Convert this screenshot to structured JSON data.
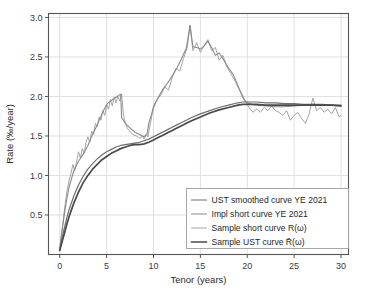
{
  "chart_data": {
    "type": "line",
    "title": "",
    "xlabel": "Tenor (years)",
    "ylabel": "Rate (‰/year)",
    "xlim": [
      -1.2,
      30.8
    ],
    "ylim": [
      0.0,
      3.05
    ],
    "xticks": [
      0,
      5,
      10,
      15,
      20,
      25,
      30
    ],
    "xtick_labels": [
      "0",
      "5",
      "10",
      "15",
      "20",
      "25",
      "30"
    ],
    "yticks": [
      0.5,
      1.0,
      1.5,
      2.0,
      2.5,
      3.0
    ],
    "ytick_labels": [
      "0.5",
      "1.0",
      "1.5",
      "2.0",
      "2.5",
      "3.0"
    ],
    "grid": true,
    "grid_color": "#d8d8d8",
    "legend_position": "lower right",
    "background": "#ffffff",
    "series": [
      {
        "name": "UST smoothed curve YE 2021",
        "legend_label": "UST smoothed curve YE 2021",
        "color": "#6e6e6e",
        "width": 1.2,
        "style": "smooth",
        "x": [
          0.0,
          0.25,
          0.5,
          0.75,
          1.0,
          1.5,
          2.0,
          2.5,
          3.0,
          3.5,
          4.0,
          4.5,
          5.0,
          5.5,
          6.0,
          6.5,
          7.0,
          7.5,
          8.0,
          8.5,
          9.0,
          9.5,
          10.0,
          10.5,
          11.0,
          11.5,
          12.0,
          12.5,
          13.0,
          13.5,
          14.0,
          15.0,
          16.0,
          17.0,
          18.0,
          19.0,
          19.5,
          20.0,
          21.0,
          22.0,
          23.0,
          24.0,
          25.0,
          26.0,
          27.0,
          28.0,
          29.0,
          30.0
        ],
        "y": [
          0.06,
          0.21,
          0.34,
          0.46,
          0.57,
          0.74,
          0.88,
          0.99,
          1.08,
          1.15,
          1.21,
          1.26,
          1.3,
          1.33,
          1.36,
          1.38,
          1.39,
          1.4,
          1.41,
          1.42,
          1.44,
          1.46,
          1.49,
          1.52,
          1.55,
          1.58,
          1.61,
          1.64,
          1.67,
          1.7,
          1.73,
          1.78,
          1.82,
          1.86,
          1.89,
          1.92,
          1.93,
          1.93,
          1.93,
          1.92,
          1.92,
          1.91,
          1.91,
          1.9,
          1.9,
          1.9,
          1.89,
          1.89
        ]
      },
      {
        "name": "Impl short curve YE 2021",
        "legend_label": "Impl short curve YE 2021",
        "color": "#8a8a8a",
        "width": 1.1,
        "style": "piecewise",
        "x": [
          0.0,
          0.25,
          0.5,
          0.75,
          1.0,
          1.5,
          2.0,
          2.5,
          3.0,
          3.5,
          4.0,
          4.5,
          5.0,
          5.5,
          6.0,
          6.5,
          6.6,
          7.0,
          7.5,
          8.0,
          8.5,
          9.0,
          9.3,
          9.5,
          10.0,
          10.5,
          11.0,
          11.5,
          12.0,
          12.5,
          13.0,
          13.5,
          13.9,
          14.2,
          14.6,
          15.0,
          15.4,
          15.8,
          16.2,
          16.6,
          17.0,
          17.5,
          18.0,
          18.5,
          19.0,
          19.5,
          19.8,
          20.0,
          20.5,
          21.0,
          22.0,
          23.0,
          24.0,
          25.0,
          26.0,
          27.0,
          28.0,
          29.0,
          30.0
        ],
        "y": [
          0.06,
          0.3,
          0.52,
          0.7,
          0.86,
          1.06,
          1.18,
          1.27,
          1.38,
          1.52,
          1.64,
          1.78,
          1.9,
          1.95,
          1.99,
          2.03,
          1.73,
          1.66,
          1.6,
          1.55,
          1.52,
          1.49,
          1.52,
          1.66,
          1.86,
          1.99,
          2.09,
          2.17,
          2.26,
          2.36,
          2.48,
          2.61,
          2.9,
          2.63,
          2.62,
          2.6,
          2.64,
          2.7,
          2.62,
          2.52,
          2.55,
          2.46,
          2.36,
          2.28,
          2.14,
          1.99,
          1.94,
          1.92,
          1.9,
          1.89,
          1.88,
          1.87,
          1.87,
          1.88,
          1.89,
          1.9,
          1.89,
          1.89,
          1.88
        ]
      },
      {
        "name": "Sample short curve R(ω)",
        "legend_label": "Sample short curve R(ω)",
        "color": "#9a9a9a",
        "width": 0.9,
        "style": "noisy",
        "x": [
          0.0,
          0.2,
          0.4,
          0.6,
          0.8,
          1.0,
          1.2,
          1.4,
          1.6,
          1.8,
          2.0,
          2.2,
          2.4,
          2.6,
          2.8,
          3.0,
          3.2,
          3.4,
          3.6,
          3.8,
          4.0,
          4.2,
          4.4,
          4.6,
          4.8,
          5.0,
          5.2,
          5.4,
          5.6,
          5.8,
          6.0,
          6.2,
          6.4,
          6.6,
          6.8,
          7.0,
          7.2,
          7.4,
          7.6,
          7.8,
          8.0,
          8.2,
          8.4,
          8.6,
          8.8,
          9.0,
          9.2,
          9.4,
          9.6,
          9.8,
          10.0,
          10.4,
          10.8,
          11.2,
          11.6,
          12.0,
          12.4,
          12.8,
          13.2,
          13.6,
          13.9,
          14.2,
          14.6,
          15.0,
          15.4,
          15.8,
          16.2,
          16.6,
          17.0,
          17.4,
          17.8,
          18.2,
          18.6,
          19.0,
          19.4,
          19.8,
          20.2,
          20.6,
          21.0,
          21.4,
          21.8,
          22.2,
          22.6,
          23.0,
          23.4,
          23.8,
          24.2,
          24.6,
          25.0,
          25.4,
          25.8,
          26.2,
          26.6,
          27.0,
          27.4,
          27.8,
          28.2,
          28.6,
          29.0,
          29.4,
          29.8,
          30.0
        ],
        "y": [
          0.08,
          0.28,
          0.46,
          0.66,
          0.82,
          0.94,
          1.03,
          1.14,
          1.06,
          1.18,
          1.3,
          1.22,
          1.34,
          1.28,
          1.42,
          1.49,
          1.42,
          1.56,
          1.52,
          1.66,
          1.62,
          1.74,
          1.7,
          1.82,
          1.76,
          1.9,
          1.84,
          1.96,
          1.88,
          1.99,
          1.92,
          2.0,
          1.94,
          2.03,
          1.76,
          1.66,
          1.6,
          1.57,
          1.54,
          1.52,
          1.51,
          1.5,
          1.48,
          1.47,
          1.5,
          1.46,
          1.52,
          1.49,
          1.62,
          1.74,
          1.88,
          1.96,
          2.02,
          2.12,
          2.08,
          2.24,
          2.36,
          2.32,
          2.48,
          2.62,
          2.9,
          2.58,
          2.68,
          2.56,
          2.64,
          2.72,
          2.58,
          2.62,
          2.46,
          2.52,
          2.38,
          2.3,
          2.22,
          2.12,
          2.04,
          1.94,
          1.86,
          1.8,
          1.84,
          1.8,
          1.86,
          1.82,
          1.88,
          1.82,
          1.8,
          1.76,
          1.82,
          1.7,
          1.76,
          1.8,
          1.72,
          1.66,
          1.78,
          1.98,
          1.82,
          1.86,
          1.8,
          1.84,
          1.78,
          1.86,
          1.74,
          1.76
        ]
      },
      {
        "name": "Sample UST curve R̄(ω)",
        "legend_label": "Sample UST curve R̄(ω)",
        "color": "#4a4a4a",
        "width": 1.7,
        "style": "smooth",
        "x": [
          0.0,
          0.25,
          0.5,
          0.75,
          1.0,
          1.5,
          2.0,
          2.5,
          3.0,
          3.5,
          4.0,
          4.5,
          5.0,
          5.5,
          6.0,
          6.5,
          7.0,
          7.5,
          8.0,
          8.5,
          9.0,
          9.5,
          10.0,
          10.5,
          11.0,
          11.5,
          12.0,
          12.5,
          13.0,
          13.5,
          14.0,
          15.0,
          16.0,
          17.0,
          18.0,
          19.0,
          19.5,
          20.0,
          21.0,
          22.0,
          23.0,
          24.0,
          25.0,
          26.0,
          27.0,
          28.0,
          29.0,
          30.0
        ],
        "y": [
          0.05,
          0.16,
          0.27,
          0.38,
          0.48,
          0.65,
          0.79,
          0.91,
          1.0,
          1.08,
          1.14,
          1.2,
          1.24,
          1.28,
          1.31,
          1.34,
          1.36,
          1.38,
          1.39,
          1.39,
          1.4,
          1.42,
          1.45,
          1.48,
          1.51,
          1.54,
          1.57,
          1.6,
          1.63,
          1.66,
          1.69,
          1.74,
          1.79,
          1.83,
          1.86,
          1.89,
          1.9,
          1.9,
          1.9,
          1.89,
          1.89,
          1.89,
          1.89,
          1.89,
          1.89,
          1.89,
          1.89,
          1.88
        ]
      }
    ]
  },
  "legend": {
    "entries": [
      {
        "label": "UST smoothed curve YE 2021"
      },
      {
        "label": "Impl short curve YE 2021"
      },
      {
        "label": "Sample short curve R(ω)"
      },
      {
        "label": "Sample UST curve R̄(ω)"
      }
    ]
  }
}
